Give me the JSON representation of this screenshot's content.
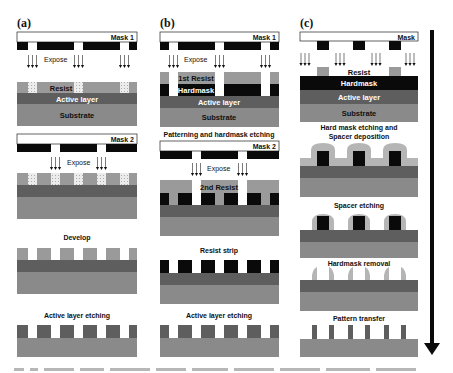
{
  "figure": {
    "panels": [
      {
        "id": "a",
        "label": "(a)",
        "mask1_label": "Mask 1",
        "expose1_label": "Expose",
        "layers": {
          "resist": "Resist",
          "active": "Active layer",
          "substrate": "Substrate"
        },
        "mask2_label": "Mask 2",
        "expose2_label": "Expose",
        "step3_label": "Develop",
        "step4_label": "Active layer etching"
      },
      {
        "id": "b",
        "label": "(b)",
        "mask1_label": "Mask 1",
        "expose1_label": "Expose",
        "layers": {
          "resist1": "1st Resist",
          "hardmask": "Hardmask",
          "active": "Active layer",
          "substrate": "Substrate"
        },
        "step2_label": "Patterning and hardmask etching",
        "mask2_label": "Mask 2",
        "expose2_label": "Expose",
        "resist2": "2nd Resist",
        "step3_label": "Resist strip",
        "step4_label": "Active layer etching"
      },
      {
        "id": "c",
        "label": "(c)",
        "mask_label": "Mask",
        "layers": {
          "resist": "Resist",
          "hardmask": "Hardmask",
          "active": "Active layer",
          "substrate": "Substrate"
        },
        "step2_label_line1": "Hard mask etching and",
        "step2_label_line2": "Spacer deposition",
        "step3_label": "Spacer etching",
        "step4_label": "Hardmask removal",
        "step5_label": "Pattern transfer"
      }
    ],
    "colors": {
      "mask_black": "#0a0a0a",
      "resist": "#9a9a9a",
      "active_layer": "#5e5e5e",
      "substrate": "#8a8a8a",
      "hardmask": "#0a0a0a",
      "spacer": "#b5b5b5",
      "exposed": "#e8e8e8"
    },
    "process_arrow": "down-arrow"
  }
}
